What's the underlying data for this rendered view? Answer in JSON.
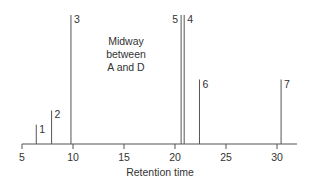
{
  "chart_data": {
    "type": "bar",
    "subtype": "stick-chromatogram",
    "title": "",
    "xlabel": "Retention time",
    "ylabel": "",
    "xlim": [
      5,
      32
    ],
    "xticks": [
      5,
      10,
      15,
      20,
      25,
      30
    ],
    "ylim": [
      0,
      100
    ],
    "grid": false,
    "legend": null,
    "annotation": [
      "Midway",
      "between",
      "A and D"
    ],
    "peaks": [
      {
        "label": "1",
        "x": 6.4,
        "height": 15
      },
      {
        "label": "2",
        "x": 7.9,
        "height": 26
      },
      {
        "label": "3",
        "x": 9.8,
        "height": 100
      },
      {
        "label": "5",
        "x": 20.6,
        "height": 100
      },
      {
        "label": "4",
        "x": 20.9,
        "height": 100
      },
      {
        "label": "6",
        "x": 22.4,
        "height": 50
      },
      {
        "label": "7",
        "x": 30.4,
        "height": 50
      }
    ]
  },
  "colors": {
    "line": "#555555",
    "text": "#333333"
  }
}
